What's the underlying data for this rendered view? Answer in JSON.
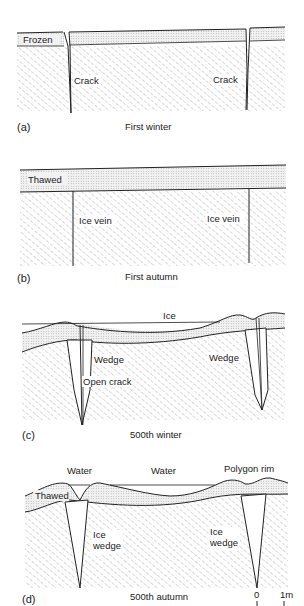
{
  "figure": {
    "panels": [
      {
        "id": "a",
        "panel_label": "(a)",
        "caption": "First winter",
        "labels": {
          "layer": "Frozen",
          "crack_left": "Crack",
          "crack_right": "Crack"
        }
      },
      {
        "id": "b",
        "panel_label": "(b)",
        "caption": "First autumn",
        "labels": {
          "layer": "Thawed",
          "vein_left": "Ice vein",
          "vein_right": "Ice vein"
        }
      },
      {
        "id": "c",
        "panel_label": "(c)",
        "caption": "500th winter",
        "labels": {
          "ice": "Ice",
          "wedge_left": "Wedge",
          "wedge_right": "Wedge",
          "open_crack": "Open crack"
        }
      },
      {
        "id": "d",
        "panel_label": "(d)",
        "caption": "500th autumn",
        "labels": {
          "water_left": "Water",
          "water_center": "Water",
          "polygon_rim": "Polygon rim",
          "thawed": "Thawed",
          "ice_left_1": "Ice",
          "ice_left_2": "wedge",
          "ice_right_1": "Ice",
          "ice_right_2": "wedge"
        }
      }
    ],
    "scale_bar": {
      "start": "0",
      "end": "1m"
    }
  }
}
